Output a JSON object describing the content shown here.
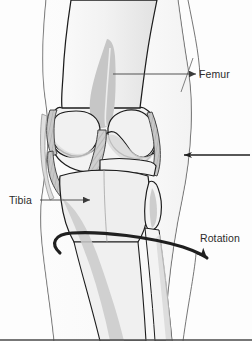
{
  "figure": {
    "background_color": "#fdfdfd"
  },
  "annotations": [
    {
      "id": "femur",
      "label": "Femur",
      "text_x": 199,
      "text_y": 78,
      "leader": "M196,74 L110,74",
      "arrow_tip": [
        110,
        74
      ],
      "arrow_dir": "left",
      "tick": "M193,58 L181,92"
    },
    {
      "id": "tibia",
      "label": "Tibia",
      "text_x": 9,
      "text_y": 204,
      "leader": "M40,200 L93,200",
      "arrow_tip": [
        93,
        200
      ],
      "arrow_dir": "right",
      "tick": null
    },
    {
      "id": "rotation",
      "label": "Rotation",
      "text_x": 200,
      "text_y": 242,
      "leader": null,
      "arrow_tip": null,
      "arrow_dir": null,
      "tick": null
    }
  ],
  "force_arrow": {
    "id": "lateral-force-arrow",
    "description": "horizontal arrow pointing left at the lateral knee",
    "path": "M250,155 L180,155",
    "tip_x": 180,
    "tip_y": 155
  },
  "rotation_arrow": {
    "id": "rotation-ellipse-arrow",
    "description": "open elliptical arrow encircling the tibia indicating axial rotation",
    "tip_x": 209,
    "tip_y": 256
  },
  "colors": {
    "outline": "#1c1c1c",
    "skin_line": "#4d4d4d",
    "bone_fill": "#eeeeee",
    "bone_fill_light": "#f6f6f6",
    "cartilage": "#e3e3e3",
    "shadow_gray": "#c9c9c9",
    "dark_gray": "#b4b4b4",
    "ligament": "#cfcfcf",
    "label_text": "#2b2b2b",
    "arrow": "#1f1f1f",
    "background": "#fdfdfd"
  },
  "structures": [
    {
      "name": "femur-shaft",
      "kind": "bone"
    },
    {
      "name": "femur-trochlear-groove",
      "kind": "bone-shading"
    },
    {
      "name": "medial-femoral-condyle",
      "kind": "bone"
    },
    {
      "name": "lateral-femoral-condyle",
      "kind": "bone"
    },
    {
      "name": "anterior-cruciate-ligament",
      "kind": "ligament"
    },
    {
      "name": "medial-collateral-ligament",
      "kind": "ligament"
    },
    {
      "name": "lateral-collateral-ligament",
      "kind": "ligament"
    },
    {
      "name": "tibial-plateau",
      "kind": "bone"
    },
    {
      "name": "tibia-shaft",
      "kind": "bone"
    },
    {
      "name": "fibula-head",
      "kind": "bone"
    },
    {
      "name": "fibula-shaft",
      "kind": "bone"
    },
    {
      "name": "skin-outline-lateral",
      "kind": "contour"
    },
    {
      "name": "skin-outline-medial",
      "kind": "contour"
    }
  ]
}
